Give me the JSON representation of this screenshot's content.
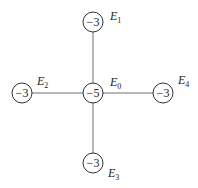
{
  "diagram": {
    "type": "star-graph",
    "nodes": [
      {
        "id": "E0",
        "value": "−5",
        "label": "E",
        "sub": "0",
        "cx": 93,
        "cy": 93,
        "lx": 110,
        "ly": 86
      },
      {
        "id": "E1",
        "value": "−3",
        "label": "E",
        "sub": "1",
        "cx": 93,
        "cy": 22,
        "lx": 110,
        "ly": 20
      },
      {
        "id": "E2",
        "value": "−3",
        "label": "E",
        "sub": "2",
        "cx": 22,
        "cy": 93,
        "lx": 37,
        "ly": 85
      },
      {
        "id": "E3",
        "value": "−3",
        "label": "E",
        "sub": "3",
        "cx": 93,
        "cy": 163,
        "lx": 108,
        "ly": 177
      },
      {
        "id": "E4",
        "value": "−3",
        "label": "E",
        "sub": "4",
        "cx": 163,
        "cy": 93,
        "lx": 178,
        "ly": 84
      }
    ],
    "edges": [
      [
        "E0",
        "E1"
      ],
      [
        "E0",
        "E2"
      ],
      [
        "E0",
        "E3"
      ],
      [
        "E0",
        "E4"
      ]
    ]
  }
}
